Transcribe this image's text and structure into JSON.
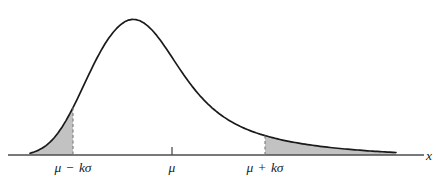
{
  "figure": {
    "background_color": "#ffffff",
    "curve_color": "#1a1a1a",
    "axis_color": "#4d4d4d",
    "shade_color": "#c2c2c2",
    "dash_color": "#7a7a7a",
    "text_color": "#1a1a1a"
  },
  "axis": {
    "x_axis_label": "x",
    "baseline_y": 155,
    "x_start": 8,
    "x_end": 424
  },
  "ticks": [
    {
      "id": "mu-minus-k-sigma",
      "label": "μ − kσ",
      "mu": "μ",
      "operator": "−",
      "k_sigma": "kσ",
      "x": 73,
      "has_dashed_line": true,
      "has_tick_mark": false
    },
    {
      "id": "mu",
      "label": "μ",
      "mu": "μ",
      "operator": "",
      "k_sigma": "",
      "x": 172,
      "has_dashed_line": false,
      "has_tick_mark": true
    },
    {
      "id": "mu-plus-k-sigma",
      "label": "μ + kσ",
      "mu": "μ",
      "operator": "+",
      "k_sigma": "kσ",
      "x": 265,
      "has_dashed_line": true,
      "has_tick_mark": false
    }
  ],
  "chart_data": {
    "type": "area",
    "title": "",
    "subtitle": "",
    "xlabel": "x",
    "ylabel": "",
    "grid": false,
    "legend": null,
    "xlim": [
      8,
      424
    ],
    "ylim": [
      0,
      155
    ],
    "annotations": [
      {
        "text": "μ − kσ",
        "x": 73,
        "y": 168
      },
      {
        "text": "μ",
        "x": 172,
        "y": 168
      },
      {
        "text": "μ + kσ",
        "x": 265,
        "y": 168
      },
      {
        "text": "x",
        "y": 155,
        "x": 430
      }
    ],
    "shaded_regions": [
      {
        "name": "left-tail",
        "from_x": 30,
        "to_x": 73
      },
      {
        "name": "right-tail",
        "from_x": 265,
        "to_x": 396
      }
    ],
    "curve_points": [
      [
        30,
        153.2
      ],
      [
        34,
        152.0
      ],
      [
        38,
        150.4
      ],
      [
        42,
        148.3
      ],
      [
        46,
        145.6
      ],
      [
        50,
        142.2
      ],
      [
        54,
        138.0
      ],
      [
        58,
        133.0
      ],
      [
        62,
        127.2
      ],
      [
        66,
        120.6
      ],
      [
        70,
        113.4
      ],
      [
        73,
        107.6
      ],
      [
        77,
        99.6
      ],
      [
        81,
        91.2
      ],
      [
        85,
        82.7
      ],
      [
        89,
        74.2
      ],
      [
        93,
        65.9
      ],
      [
        97,
        58.0
      ],
      [
        101,
        50.6
      ],
      [
        105,
        43.8
      ],
      [
        109,
        37.8
      ],
      [
        113,
        32.5
      ],
      [
        117,
        28.0
      ],
      [
        121,
        24.4
      ],
      [
        125,
        21.6
      ],
      [
        128,
        20.2
      ],
      [
        132,
        19.4
      ],
      [
        136,
        19.6
      ],
      [
        140,
        20.8
      ],
      [
        144,
        23.0
      ],
      [
        148,
        26.1
      ],
      [
        152,
        30.0
      ],
      [
        156,
        34.6
      ],
      [
        160,
        39.8
      ],
      [
        164,
        45.4
      ],
      [
        168,
        51.3
      ],
      [
        172,
        57.3
      ],
      [
        176,
        63.4
      ],
      [
        180,
        69.4
      ],
      [
        184,
        75.2
      ],
      [
        188,
        80.8
      ],
      [
        192,
        86.1
      ],
      [
        196,
        91.1
      ],
      [
        200,
        95.8
      ],
      [
        204,
        100.1
      ],
      [
        208,
        104.1
      ],
      [
        212,
        107.8
      ],
      [
        216,
        111.2
      ],
      [
        220,
        114.3
      ],
      [
        224,
        117.1
      ],
      [
        228,
        119.7
      ],
      [
        232,
        122.1
      ],
      [
        236,
        124.3
      ],
      [
        240,
        126.3
      ],
      [
        244,
        128.1
      ],
      [
        248,
        129.8
      ],
      [
        252,
        131.4
      ],
      [
        256,
        132.8
      ],
      [
        260,
        134.1
      ],
      [
        265,
        135.6
      ],
      [
        270,
        137.0
      ],
      [
        275,
        138.3
      ],
      [
        280,
        139.5
      ],
      [
        285,
        140.6
      ],
      [
        290,
        141.6
      ],
      [
        295,
        142.5
      ],
      [
        300,
        143.4
      ],
      [
        305,
        144.2
      ],
      [
        310,
        144.9
      ],
      [
        315,
        145.6
      ],
      [
        320,
        146.3
      ],
      [
        325,
        146.9
      ],
      [
        330,
        147.5
      ],
      [
        335,
        148.0
      ],
      [
        340,
        148.5
      ],
      [
        345,
        149.0
      ],
      [
        350,
        149.4
      ],
      [
        355,
        149.8
      ],
      [
        360,
        150.2
      ],
      [
        365,
        150.6
      ],
      [
        370,
        151.0
      ],
      [
        375,
        151.3
      ],
      [
        380,
        151.6
      ],
      [
        385,
        151.9
      ],
      [
        390,
        152.2
      ],
      [
        396,
        152.5
      ]
    ]
  }
}
